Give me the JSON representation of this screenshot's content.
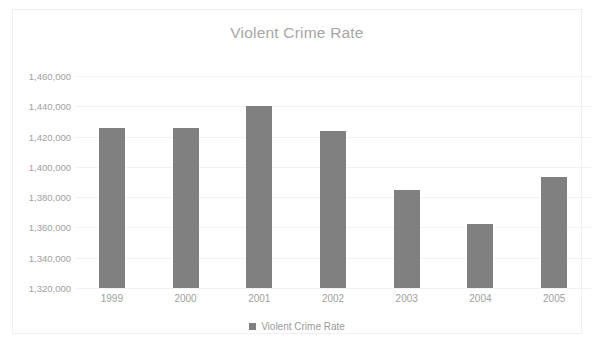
{
  "chart_data": {
    "type": "bar",
    "title": "Violent Crime Rate",
    "xlabel": "",
    "ylabel": "",
    "categories": [
      "1999",
      "2000",
      "2001",
      "2002",
      "2003",
      "2004",
      "2005"
    ],
    "series": [
      {
        "name": "Violent Crime Rate",
        "values": [
          1426000,
          1426000,
          1440500,
          1424000,
          1385000,
          1362000,
          1393000
        ]
      }
    ],
    "ylim": [
      1320000,
      1460000
    ],
    "ytick_labels": [
      "1,460,000",
      "1,440,000",
      "1,420,000",
      "1,400,000",
      "1,380,000",
      "1,360,000",
      "1,340,000",
      "1,320,000"
    ],
    "ytick_values": [
      1460000,
      1440000,
      1420000,
      1400000,
      1380000,
      1360000,
      1340000,
      1320000
    ],
    "grid": true,
    "legend": {
      "position": "bottom",
      "entries": [
        "Violent Crime Rate"
      ]
    },
    "colors": {
      "bar": "#808080",
      "title": "#a6a6a6",
      "tick_label": "#a0a0a0",
      "gridline": "#f2f2f2",
      "frame_border": "#f0f0f0",
      "background": "#ffffff"
    }
  }
}
